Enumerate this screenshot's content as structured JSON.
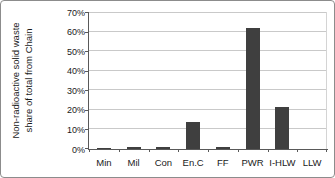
{
  "chart_data": {
    "type": "bar",
    "categories": [
      "Min",
      "Mil",
      "Con",
      "En.C",
      "FF",
      "PWR",
      "I-HLW",
      "LLW"
    ],
    "values": [
      0.5,
      1,
      1,
      14,
      1,
      62,
      21.5,
      0
    ],
    "title": "",
    "xlabel": "",
    "ylabel": "Non-radioactive solid waste share of total from Chain",
    "ylabel_lines": [
      "Non-radioactive solid waste",
      "share of total from Chain"
    ],
    "ylim": [
      0,
      70
    ],
    "ytick_step": 10,
    "ytick_labels": [
      "0%",
      "10%",
      "20%",
      "30%",
      "40%",
      "50%",
      "60%",
      "70%"
    ],
    "grid": true,
    "legend": false,
    "colors": {
      "bar": "#3f3f3f",
      "gridline": "#c9c9c9",
      "axis": "#595959",
      "plot_border": "#d4d4d4",
      "text": "#1a1a1a",
      "background": "#ffffff"
    }
  }
}
